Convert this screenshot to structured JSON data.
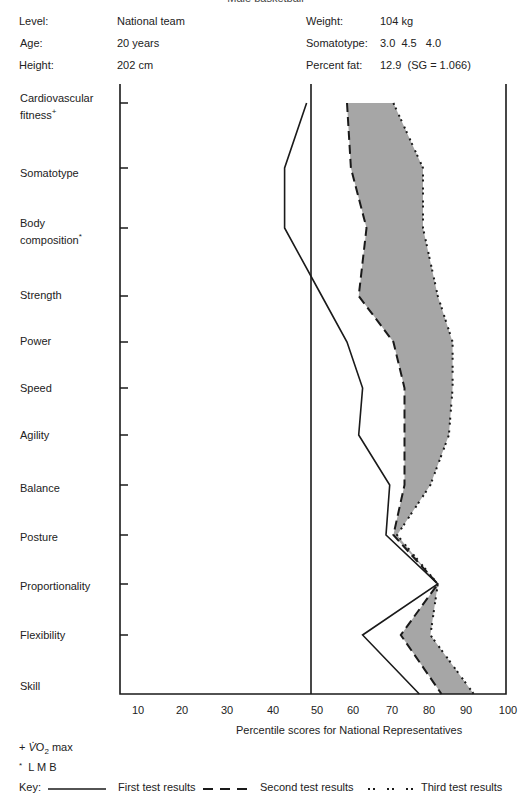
{
  "title": "Male basketball",
  "profile": {
    "left": [
      {
        "label": "Level:",
        "value": "National team"
      },
      {
        "label": "Age:",
        "value": "20 years"
      },
      {
        "label": "Height:",
        "value": "202 cm"
      }
    ],
    "right": [
      {
        "label": "Weight:",
        "value": "104 kg"
      },
      {
        "label": "Somatotype:",
        "value": "3.0  4.5   4.0"
      },
      {
        "label": "Percent fat:",
        "value": "12.9  (SG = 1.066)"
      }
    ]
  },
  "categories_display": [
    {
      "line1": "Cardiovascular",
      "line2": "fitness",
      "mark": "+"
    },
    {
      "line1": "Somatotype",
      "line2": "",
      "mark": ""
    },
    {
      "line1": "Body",
      "line2": "composition",
      "mark": "*"
    },
    {
      "line1": "Strength",
      "line2": "",
      "mark": ""
    },
    {
      "line1": "Power",
      "line2": "",
      "mark": ""
    },
    {
      "line1": "Speed",
      "line2": "",
      "mark": ""
    },
    {
      "line1": "Agility",
      "line2": "",
      "mark": ""
    },
    {
      "line1": "Balance",
      "line2": "",
      "mark": ""
    },
    {
      "line1": "Posture",
      "line2": "",
      "mark": ""
    },
    {
      "line1": "Proportionality",
      "line2": "",
      "mark": ""
    },
    {
      "line1": "Flexibility",
      "line2": "",
      "mark": ""
    },
    {
      "line1": "Skill",
      "line2": "",
      "mark": ""
    }
  ],
  "x_ticks": [
    "10",
    "20",
    "30",
    "40",
    "50",
    "60",
    "70",
    "80",
    "90",
    "100"
  ],
  "xlabel": "Percentile scores for National Representatives",
  "footnotes": {
    "plus": "+",
    "vo2": "V",
    "o2_o": "O",
    "o2_sub": "2",
    "o2_max": " max",
    "star": "*",
    "lmb": "L M B"
  },
  "legend": {
    "key_label": "Key:",
    "first": "First test results",
    "second": "Second test results",
    "third": "Third test results"
  },
  "colors": {
    "line": "#1a1a1a",
    "fill": "#a6a6a6",
    "axis": "#1a1a1a"
  },
  "chart_data": {
    "type": "line",
    "title": "Male basketball",
    "orientation": "horizontal-profile",
    "categories": [
      "Cardiovascular fitness",
      "Somatotype",
      "Body composition",
      "Strength",
      "Power",
      "Speed",
      "Agility",
      "Balance",
      "Posture",
      "Proportionality",
      "Flexibility",
      "Skill"
    ],
    "series": [
      {
        "name": "First test results",
        "style": "solid",
        "values": [
          49,
          44,
          44,
          53,
          60,
          64,
          63,
          71,
          70,
          84,
          64,
          79
        ]
      },
      {
        "name": "Second test results",
        "style": "dashed",
        "values": [
          60,
          61,
          65,
          63,
          72,
          75,
          75,
          75,
          72,
          84,
          74,
          85
        ]
      },
      {
        "name": "Third test results",
        "style": "dotted",
        "values": [
          72,
          80,
          80,
          84,
          88,
          88,
          87,
          82,
          73,
          84,
          82,
          93
        ]
      }
    ],
    "shaded_region": "between second and third test results",
    "reference_line": 50,
    "xlabel": "Percentile scores for National Representatives",
    "ylabel": "",
    "xlim": [
      5,
      100
    ],
    "x_ticks": [
      10,
      20,
      30,
      40,
      50,
      60,
      70,
      80,
      90,
      100
    ],
    "grid": false,
    "legend_position": "bottom",
    "annotations": [
      "+ VO2 max",
      "* LMB"
    ]
  }
}
